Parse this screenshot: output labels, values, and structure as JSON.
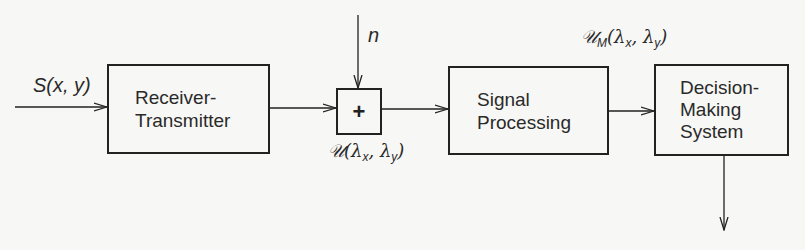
{
  "diagram": {
    "type": "block-diagram",
    "colors": {
      "line": "#222222",
      "background": "#f7f7f5"
    },
    "blocks": [
      {
        "id": "receiver-transmitter",
        "lines": [
          "Receiver-",
          "Transmitter"
        ]
      },
      {
        "id": "summer",
        "symbol": "+"
      },
      {
        "id": "signal-processing",
        "lines": [
          "Signal",
          "Processing"
        ]
      },
      {
        "id": "decision-making",
        "lines": [
          "Decision-",
          "Making",
          "System"
        ]
      }
    ],
    "labels": {
      "input": {
        "main": "S(x, y)"
      },
      "noise": {
        "main": "n"
      },
      "summer_output": {
        "script": "𝒰",
        "open": "(λ",
        "sub1": "x",
        "mid": ", λ",
        "sub2": "y",
        "close": ")"
      },
      "processed_output": {
        "script": "𝒰",
        "sub0": "M",
        "open": "(λ",
        "sub1": "x",
        "mid": ", λ",
        "sub2": "y",
        "close": ")"
      }
    },
    "connections": [
      {
        "from": "input",
        "to": "receiver-transmitter"
      },
      {
        "from": "receiver-transmitter",
        "to": "summer"
      },
      {
        "from": "noise",
        "to": "summer"
      },
      {
        "from": "summer",
        "to": "signal-processing"
      },
      {
        "from": "signal-processing",
        "to": "decision-making"
      },
      {
        "from": "decision-making",
        "to": "output"
      }
    ]
  }
}
